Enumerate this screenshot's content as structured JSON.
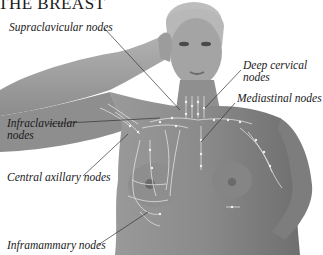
{
  "title": "THE BREAST",
  "labels": {
    "supraclavicular": "Supraclavicular nodes",
    "deep_cervical_line1": "Deep cervical",
    "deep_cervical_line2": "nodes",
    "mediastinal": "Mediastinal nodes",
    "infraclavicular_line1": "Infraclavicular",
    "infraclavicular_line2": "nodes",
    "central_axillary": "Central axillary nodes",
    "inframammary": "Inframammary nodes"
  },
  "colors": {
    "background": "#ffffff",
    "skin": "#8c8c8c",
    "skin_light": "#a8a8a8",
    "skin_dark": "#6e6e6e",
    "hair": "#b5b5b5",
    "lymph": "#e8e8e8",
    "leader_line": "#333333",
    "text": "#1a1a1a"
  }
}
